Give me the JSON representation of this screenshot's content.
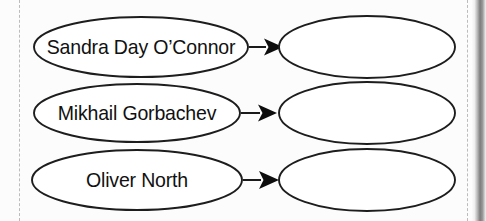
{
  "worksheet": {
    "background_color": "#fcfcfc",
    "ink_color": "#1d1d1d",
    "guide_line_color": "#bcbcbc"
  },
  "diagram": {
    "type": "concept-map",
    "orientation": "left-to-right",
    "rows": [
      {
        "id": "row-1",
        "source": {
          "label": "Sandra Day O’Connor",
          "shape": "ellipse",
          "filled": true
        },
        "connector": {
          "kind": "arrow",
          "direction": "right"
        },
        "target": {
          "label": "",
          "shape": "ellipse",
          "filled": false
        }
      },
      {
        "id": "row-2",
        "source": {
          "label": "Mikhail Gorbachev",
          "shape": "ellipse",
          "filled": true
        },
        "connector": {
          "kind": "arrow",
          "direction": "right"
        },
        "target": {
          "label": "",
          "shape": "ellipse",
          "filled": false
        }
      },
      {
        "id": "row-3",
        "source": {
          "label": "Oliver North",
          "shape": "ellipse",
          "filled": true
        },
        "connector": {
          "kind": "arrow",
          "direction": "right"
        },
        "target": {
          "label": "",
          "shape": "ellipse",
          "filled": false
        }
      }
    ]
  }
}
